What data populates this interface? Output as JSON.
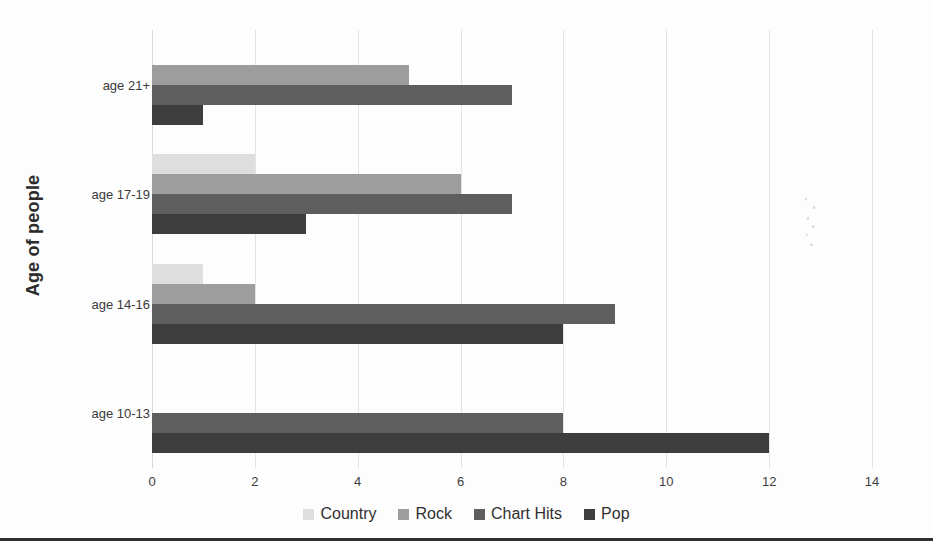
{
  "chart_data": {
    "type": "bar",
    "orientation": "horizontal",
    "title": "",
    "xlabel": "",
    "ylabel": "Age of people",
    "xlim": [
      0,
      14
    ],
    "xticks": [
      0,
      2,
      4,
      6,
      8,
      10,
      12,
      14
    ],
    "xtick_labels": [
      "0",
      "2",
      "4",
      "6",
      "8",
      "10",
      "12",
      "14"
    ],
    "grid": true,
    "grid_axis": "x",
    "legend_position": "bottom",
    "categories": [
      "age 10-13",
      "age 14-16",
      "age 17-19",
      "age 21+"
    ],
    "series": [
      {
        "name": "Country",
        "color": "#dedede",
        "values": [
          0,
          1,
          2,
          0
        ]
      },
      {
        "name": "Rock",
        "color": "#9d9d9d",
        "values": [
          0,
          2,
          6,
          5
        ]
      },
      {
        "name": "Chart Hits",
        "color": "#5e5e5e",
        "values": [
          8,
          9,
          7,
          7
        ]
      },
      {
        "name": "Pop",
        "color": "#3d3d3d",
        "values": [
          12,
          8,
          3,
          1
        ]
      }
    ]
  },
  "axis": {
    "y_title": "Age of people"
  },
  "legend": {
    "items": [
      {
        "label": "Country",
        "color": "#dedede"
      },
      {
        "label": "Rock",
        "color": "#9d9d9d"
      },
      {
        "label": "Chart Hits",
        "color": "#5e5e5e"
      },
      {
        "label": "Pop",
        "color": "#3d3d3d"
      }
    ]
  }
}
